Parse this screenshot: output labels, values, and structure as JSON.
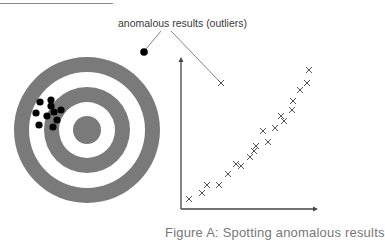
{
  "figure": {
    "annotation": "anomalous results (outliers)",
    "caption": "Figure A: Spotting anomalous results",
    "colors": {
      "ring_gray": "#7a7a7a",
      "dot": "#000000",
      "axis": "#444444",
      "marker": "#555555",
      "text": "#3a3a3a"
    }
  },
  "target": {
    "center": [
      87,
      130
    ],
    "ring_radii": [
      73,
      58,
      43,
      28,
      14
    ],
    "hits": [
      [
        40,
        102
      ],
      [
        51,
        100
      ],
      [
        51,
        106
      ],
      [
        36,
        113
      ],
      [
        47,
        116
      ],
      [
        54,
        112
      ],
      [
        61,
        110
      ],
      [
        57,
        120
      ],
      [
        39,
        125
      ],
      [
        53,
        127
      ]
    ],
    "outlier": [
      144,
      52
    ]
  },
  "scatter": {
    "axis_origin": [
      181,
      209
    ],
    "axis_y_top": 57,
    "axis_x_right": 318,
    "points": [
      [
        189,
        199
      ],
      [
        202,
        193
      ],
      [
        207,
        185
      ],
      [
        219,
        185
      ],
      [
        228,
        174
      ],
      [
        236,
        164
      ],
      [
        241,
        166
      ],
      [
        250,
        157
      ],
      [
        254,
        151
      ],
      [
        256,
        146
      ],
      [
        263,
        131
      ],
      [
        268,
        142
      ],
      [
        275,
        128
      ],
      [
        281,
        116
      ],
      [
        284,
        121
      ],
      [
        292,
        110
      ],
      [
        293,
        101
      ],
      [
        300,
        90
      ],
      [
        307,
        83
      ],
      [
        309,
        70
      ]
    ],
    "outlier": [
      221,
      83
    ]
  }
}
